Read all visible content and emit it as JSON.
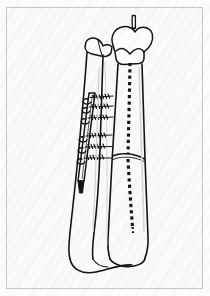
{
  "figure": {
    "domain": "Natural-Image",
    "media": "scanned line drawing on white paper",
    "title": "",
    "caption": "",
    "labels": [],
    "background_color": "#fdfdfd",
    "frame_color": "#c9c9c9",
    "ink_color": "#141414",
    "bone_fill": "#ffffff",
    "shadow_color": "#9a9a9a"
  },
  "scene": {
    "name": "anteroposterior line drawing of lower leg bones with internal fixation",
    "view": "anterior-posterior",
    "structures": [
      {
        "id": "tibia",
        "name": "tibia",
        "side": "right-of-image",
        "description": "long bone with flared proximal plateau and distal medial malleolus",
        "features": [
          "tibial-plateau",
          "tibial-spine",
          "shaft",
          "medial-malleolus"
        ]
      },
      {
        "id": "fibula",
        "name": "fibula",
        "side": "left-of-image",
        "description": "slender long bone lateral to tibia with head proximally and lateral malleolus distally",
        "features": [
          "fibular-head",
          "shaft",
          "lateral-malleolus"
        ]
      },
      {
        "id": "fixation-plate",
        "name": "bone plate",
        "description": "narrow metal plate applied along the fibula / lateral tibia with helical screw heads",
        "screw_count": 6
      },
      {
        "id": "intramedullary-nail",
        "name": "intramedullary nail",
        "description": "nail shown as dashed line running the length of the tibial medullary canal",
        "render": "dashed"
      },
      {
        "id": "proximal-pin",
        "name": "proximal guide pin",
        "description": "short pin protruding from the top of the tibial plateau"
      },
      {
        "id": "fracture-line",
        "name": "transverse fracture line",
        "description": "transverse break across the mid-distal tibial shaft"
      }
    ],
    "screws": [
      {
        "index": 1,
        "label": "screw-1"
      },
      {
        "index": 2,
        "label": "screw-2"
      },
      {
        "index": 3,
        "label": "screw-3"
      },
      {
        "index": 4,
        "label": "screw-4"
      },
      {
        "index": 5,
        "label": "screw-5"
      },
      {
        "index": 6,
        "label": "screw-6"
      }
    ]
  }
}
